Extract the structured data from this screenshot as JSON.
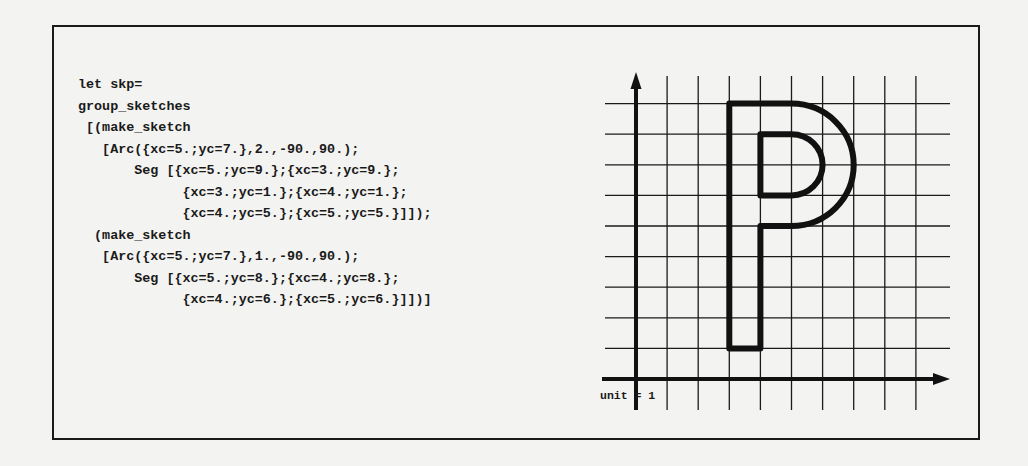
{
  "figure": {
    "code_block": {
      "lines": [
        {
          "indent": 0,
          "text": "let skp="
        },
        {
          "indent": 0,
          "text": "group_sketches"
        },
        {
          "indent": 1,
          "text": "[(make_sketch"
        },
        {
          "indent": 3,
          "text": "[Arc({xc=5.;yc=7.},2.,-90.,90.);"
        },
        {
          "indent": 7,
          "text": "Seg [{xc=5.;yc=9.};{xc=3.;yc=9.};"
        },
        {
          "indent": 13,
          "text": "{xc=3.;yc=1.};{xc=4.;yc=1.};"
        },
        {
          "indent": 13,
          "text": "{xc=4.;yc=5.};{xc=5.;yc=5.}]]);"
        },
        {
          "indent": 2,
          "text": "(make_sketch"
        },
        {
          "indent": 3,
          "text": "[Arc({xc=5.;yc=7.},1.,-90.,90.);"
        },
        {
          "indent": 7,
          "text": "Seg [{xc=5.;yc=8.};{xc=4.;yc=8.};"
        },
        {
          "indent": 13,
          "text": "{xc=4.;yc=6.};{xc=5.;yc=6.}]])]"
        }
      ]
    },
    "plot": {
      "unit_label": "unit = 1",
      "grid": {
        "x_ticks": [
          0,
          1,
          2,
          3,
          4,
          5,
          6,
          7,
          8,
          9
        ],
        "y_ticks": [
          1,
          2,
          3,
          4,
          5,
          6,
          7,
          8,
          9
        ]
      },
      "shape_letter": "P",
      "sketches": [
        {
          "arc": {
            "xc": 5,
            "yc": 7,
            "radius": 2,
            "start_angle": -90,
            "end_angle": 90
          },
          "segment_points": [
            {
              "xc": 5,
              "yc": 9
            },
            {
              "xc": 3,
              "yc": 9
            },
            {
              "xc": 3,
              "yc": 1
            },
            {
              "xc": 4,
              "yc": 1
            },
            {
              "xc": 4,
              "yc": 5
            },
            {
              "xc": 5,
              "yc": 5
            }
          ]
        },
        {
          "arc": {
            "xc": 5,
            "yc": 7,
            "radius": 1,
            "start_angle": -90,
            "end_angle": 90
          },
          "segment_points": [
            {
              "xc": 5,
              "yc": 8
            },
            {
              "xc": 4,
              "yc": 8
            },
            {
              "xc": 4,
              "yc": 6
            },
            {
              "xc": 5,
              "yc": 6
            }
          ]
        }
      ]
    }
  }
}
